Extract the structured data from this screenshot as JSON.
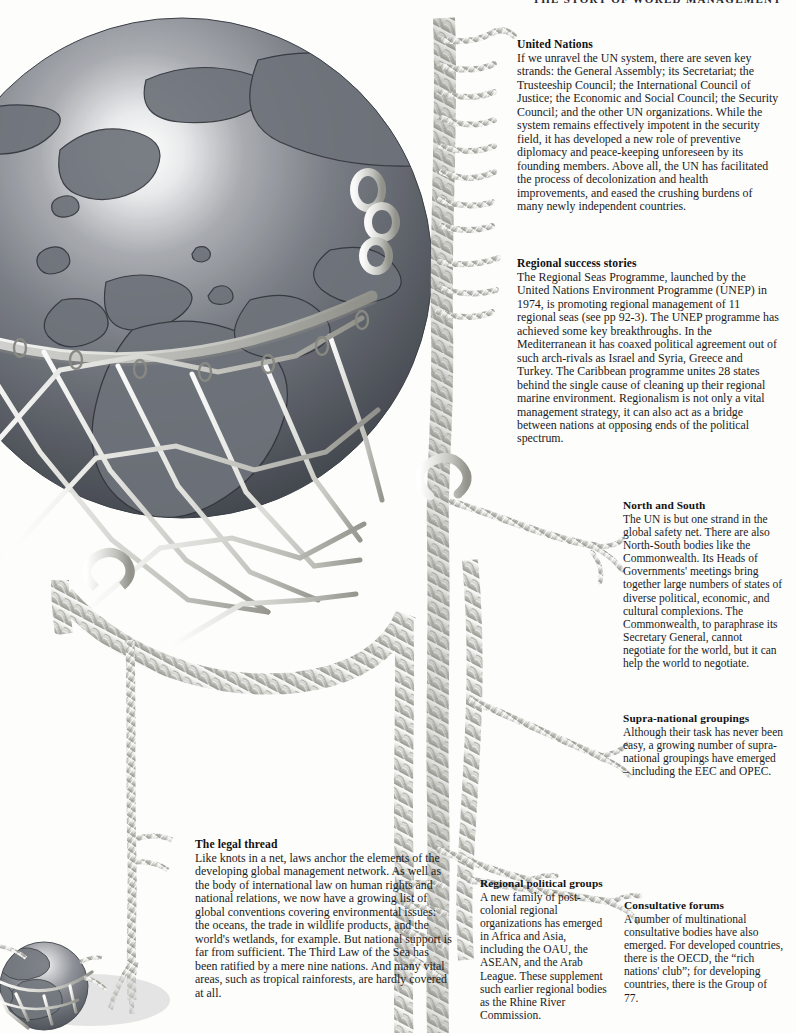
{
  "page": {
    "running_head": "THE STORY OF WORLD MANAGEMENT",
    "background_color": "#fdfdfc",
    "ink_color": "#1a1a1a"
  },
  "illustration": {
    "name": "globe-in-safety-net",
    "description": "A shaded globe showing Europe, Africa and the North Atlantic cradled in a knotted rope net; braided rope strands run down the page, each frayed end pointing to a caption block. A second, smaller globe-in-net appears at the lower-left corner.",
    "rope_color": "#d8d8d4",
    "rope_shadow": "#8d8d8a",
    "globe_dark": "#4f5258",
    "globe_light": "#fbfbfb",
    "parts": [
      {
        "name": "main-globe",
        "label": "globe"
      },
      {
        "name": "safety-net",
        "label": "net"
      },
      {
        "name": "main-rope-strand",
        "label": "rope"
      },
      {
        "name": "small-globe",
        "label": "small globe"
      }
    ]
  },
  "blocks": [
    {
      "id": "united-nations",
      "heading": "United Nations",
      "body": "If we unravel the UN system, there are seven key strands: the General Assembly; its Secretariat; the Trusteeship Council; the International Council of Justice; the Economic and Social Council; the Security Council; and the other UN organizations. While the system remains effectively impotent in the security field, it has developed a new role of preventive diplomacy and peace-keeping unforeseen by its founding members. Above all, the UN has facilitated the process of decolonization and health improvements, and eased the crushing burdens of many newly independent countries."
    },
    {
      "id": "regional-success",
      "heading": "Regional success stories",
      "body": "The Regional Seas Programme, launched by the United Nations Environment Programme (UNEP) in 1974, is promoting regional management of 11 regional seas (see pp 92-3). The UNEP programme has achieved some key breakthroughs. In the Mediterranean it has coaxed political agreement out of such arch-rivals as Israel and Syria, Greece and Turkey. The Caribbean programme unites 28 states behind the single cause of cleaning up their regional marine environment. Regionalism is not only a vital management strategy, it can also act as a bridge between nations at opposing ends of the political spectrum."
    },
    {
      "id": "north-south",
      "heading": "North and South",
      "body": "The UN is but one strand in the global safety net. There are also North-South bodies like the Commonwealth. Its Heads of Governments' meetings bring together large numbers of states of diverse political, economic, and cultural complexions. The Commonwealth, to paraphrase its Secretary General, cannot negotiate for the world, but it can help the world to negotiate."
    },
    {
      "id": "supra-national",
      "heading": "Supra-national groupings",
      "body": "Although their task has never been easy, a growing number of supra-national groupings have emerged – including the EEC and OPEC."
    },
    {
      "id": "legal-thread",
      "heading": "The legal thread",
      "body": "Like knots in a net, laws anchor the elements of the developing global management network. As well as the body of international law on human rights and national relations, we now have a growing list of global conventions covering environmental issues: the oceans, the trade in wildlife products, and the world's wetlands, for example. But national support is far from sufficient. The Third Law of the Sea has been ratified by a mere nine nations. And many vital areas, such as tropical rainforests, are hardly covered at all."
    },
    {
      "id": "regional-political",
      "heading": "Regional political groups",
      "body": "A new family of post-colonial regional organizations has emerged in Africa and Asia, including the OAU, the ASEAN, and the Arab League. These supplement such earlier regional bodies as the Rhine River Commission."
    },
    {
      "id": "consultative",
      "heading": "Consultative forums",
      "body": "A number of multinational consultative bodies have also emerged. For developed countries, there is the OECD, the “rich nations' club”; for developing countries, there is the Group of 77."
    }
  ]
}
